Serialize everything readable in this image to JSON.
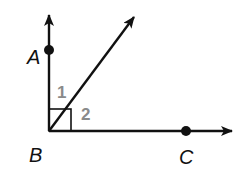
{
  "diagram": {
    "type": "angle-figure",
    "colors": {
      "line": "#111111",
      "angle_label": "#8a8a8a",
      "background": "#ffffff"
    },
    "vertex": {
      "label": "B",
      "x": 49,
      "y": 131
    },
    "points": [
      {
        "label": "A",
        "on_ray": "BA (vertical, up)",
        "x": 49,
        "y": 50
      },
      {
        "label": "C",
        "on_ray": "BC (horizontal, right)",
        "x": 186,
        "y": 130
      }
    ],
    "rays": [
      {
        "name": "ray-BA",
        "direction": "up"
      },
      {
        "name": "ray-diagonal",
        "direction": "up-right"
      },
      {
        "name": "ray-BC",
        "direction": "right"
      }
    ],
    "angles": [
      {
        "label": "1",
        "between": "ray BA and diagonal ray"
      },
      {
        "label": "2",
        "between": "diagonal ray and ray BC"
      }
    ],
    "right_angle_marker": true,
    "labels": {
      "A": "A",
      "B": "B",
      "C": "C",
      "angle1": "1",
      "angle2": "2"
    }
  }
}
